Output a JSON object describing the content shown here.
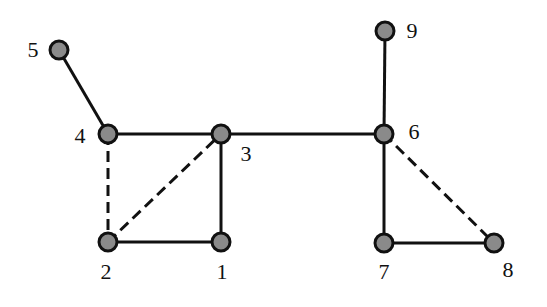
{
  "diagram": {
    "type": "undirected-graph",
    "style": {
      "edge_color": "#111111",
      "node_fill": "#8a8a8a",
      "node_stroke": "#111111",
      "background": "#ffffff"
    },
    "nodes": [
      {
        "id": "1",
        "label": "1",
        "x": 221,
        "y": 242,
        "lx": 222,
        "ly": 274
      },
      {
        "id": "2",
        "label": "2",
        "x": 108,
        "y": 242,
        "lx": 106,
        "ly": 274
      },
      {
        "id": "3",
        "label": "3",
        "x": 221,
        "y": 134,
        "lx": 246,
        "ly": 156
      },
      {
        "id": "4",
        "label": "4",
        "x": 108,
        "y": 134,
        "lx": 80,
        "ly": 138
      },
      {
        "id": "5",
        "label": "5",
        "x": 59,
        "y": 50,
        "lx": 33,
        "ly": 52
      },
      {
        "id": "6",
        "label": "6",
        "x": 384,
        "y": 134,
        "lx": 414,
        "ly": 134
      },
      {
        "id": "7",
        "label": "7",
        "x": 384,
        "y": 243,
        "lx": 384,
        "ly": 274
      },
      {
        "id": "8",
        "label": "8",
        "x": 494,
        "y": 243,
        "lx": 508,
        "ly": 272
      },
      {
        "id": "9",
        "label": "9",
        "x": 385,
        "y": 31,
        "lx": 412,
        "ly": 33
      }
    ],
    "edges": [
      {
        "from": "5",
        "to": "4",
        "style": "solid"
      },
      {
        "from": "4",
        "to": "3",
        "style": "solid"
      },
      {
        "from": "3",
        "to": "6",
        "style": "solid"
      },
      {
        "from": "3",
        "to": "1",
        "style": "solid"
      },
      {
        "from": "2",
        "to": "1",
        "style": "solid"
      },
      {
        "from": "4",
        "to": "2",
        "style": "dashed"
      },
      {
        "from": "2",
        "to": "3",
        "style": "dashed"
      },
      {
        "from": "9",
        "to": "6",
        "style": "solid"
      },
      {
        "from": "6",
        "to": "7",
        "style": "solid"
      },
      {
        "from": "7",
        "to": "8",
        "style": "solid"
      },
      {
        "from": "6",
        "to": "8",
        "style": "dashed"
      }
    ]
  }
}
